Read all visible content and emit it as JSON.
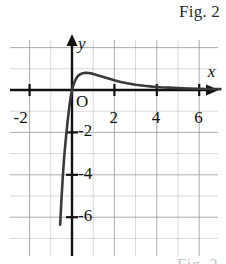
{
  "figure": {
    "caption_top": "Fig. 2",
    "caption_bottom": "Fig. 2",
    "x_axis_label": "x",
    "y_axis_label": "y",
    "origin_label": "O"
  },
  "colors": {
    "grid": "#9a9a9a",
    "axis": "#111111",
    "curve": "#3a3a3a",
    "text": "#111111",
    "caption": "#2b2b2b",
    "caption_faded": "#c8c8c8",
    "background": "#ffffff"
  },
  "chart_data": {
    "type": "line",
    "title": "Fig. 2",
    "xlabel": "x",
    "ylabel": "y",
    "grid": true,
    "legend": null,
    "xlim": [
      -3,
      7
    ],
    "ylim": [
      -7.2,
      2.5
    ],
    "x_ticks": [
      -2,
      2,
      4,
      6
    ],
    "x_tick_labels": [
      "-2",
      "2",
      "4",
      "6"
    ],
    "y_ticks": [
      -2,
      -4,
      -6
    ],
    "y_tick_labels": [
      "-2",
      "-4",
      "-6"
    ],
    "origin_label": "O",
    "gridline_step": 1,
    "annotations": [],
    "series": [
      {
        "name": "curve",
        "x": [
          -0.56,
          -0.54,
          -0.52,
          -0.5,
          -0.47,
          -0.44,
          -0.41,
          -0.38,
          -0.34,
          -0.3,
          -0.26,
          -0.22,
          -0.18,
          -0.14,
          -0.1,
          -0.06,
          -0.02,
          0.0,
          0.05,
          0.12,
          0.2,
          0.3,
          0.4,
          0.5,
          0.65,
          0.8,
          1.0,
          1.2,
          1.4,
          1.6,
          1.8,
          2.0,
          2.3,
          2.6,
          3.0,
          3.4,
          3.8,
          4.2,
          4.6,
          5.0,
          5.5,
          6.0,
          6.5,
          7.0
        ],
        "y": [
          -6.35,
          -6.0,
          -5.6,
          -5.2,
          -4.7,
          -4.2,
          -3.75,
          -3.3,
          -2.85,
          -2.4,
          -2.0,
          -1.6,
          -1.25,
          -0.9,
          -0.6,
          -0.33,
          -0.1,
          0.0,
          0.18,
          0.38,
          0.55,
          0.68,
          0.75,
          0.79,
          0.81,
          0.8,
          0.76,
          0.7,
          0.64,
          0.58,
          0.52,
          0.46,
          0.38,
          0.32,
          0.25,
          0.2,
          0.16,
          0.13,
          0.11,
          0.09,
          0.07,
          0.06,
          0.05,
          0.04
        ]
      }
    ]
  }
}
